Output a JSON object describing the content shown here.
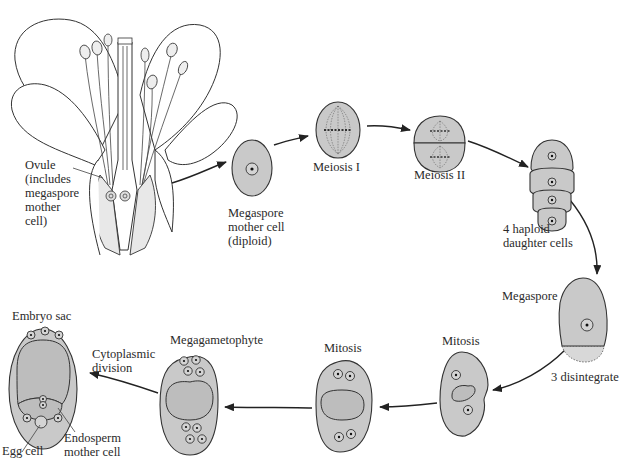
{
  "labels": {
    "ovule": "Ovule\n(includes\nmegaspore\nmother\ncell)",
    "megaspore_mother_cell": "Megaspore\nmother cell\n(diploid)",
    "meiosis_1": "Meiosis I",
    "meiosis_2": "Meiosis II",
    "haploid_cells": "4 haploid\ndaughter cells",
    "megaspore": "Megaspore",
    "disintegrate": "3 disintegrate",
    "mitosis_1": "Mitosis",
    "mitosis_2": "Mitosis",
    "megagametophyte": "Megagametophyte",
    "cytoplasmic_division": "Cytoplasmic\ndivision",
    "embryo_sac": "Embryo sac",
    "egg_cell": "Egg cell",
    "endosperm_mother_cell": "Endosperm\nmother cell"
  },
  "stages": [
    "Ovule (includes megaspore mother cell)",
    "Megaspore mother cell (diploid)",
    "Meiosis I",
    "Meiosis II",
    "4 haploid daughter cells",
    "Megaspore (3 disintegrate)",
    "Mitosis",
    "Mitosis",
    "Megagametophyte",
    "Cytoplasmic division",
    "Embryo sac"
  ],
  "colors": {
    "cell_fill": "#c9c9c9",
    "outline": "#333333",
    "background": "#ffffff"
  }
}
